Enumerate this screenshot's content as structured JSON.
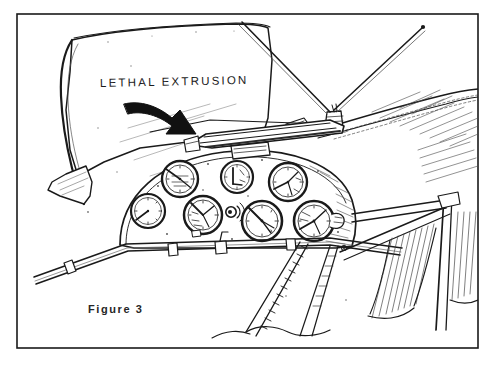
{
  "figure": {
    "caption": "Figure 3",
    "annotation_label": "LETHAL EXTRUSION",
    "medium": "hand-drawn pen-and-ink line illustration",
    "border": {
      "style": "thin black rectangle",
      "color": "#1a1a1a"
    },
    "colors": {
      "ink": "#1a1a1a",
      "paper": "#ffffff",
      "shading": "#4a4a4a",
      "caption_ink": "#262626"
    }
  },
  "scene": {
    "parts": [
      {
        "name": "windscreen-panel",
        "description": "large blank canopy / windscreen panel at upper left"
      },
      {
        "name": "extrusion-rail",
        "description": "protruding metal rail across the top of the instrument panel"
      },
      {
        "name": "instrument-panel",
        "description": "domed instrument panel carrying seven round gauges"
      },
      {
        "name": "antenna-mast",
        "description": "two wire antennas meeting at a mount on the cowling"
      },
      {
        "name": "cowling",
        "description": "engine cowling with riveted seam running to the right"
      },
      {
        "name": "wing-strut",
        "description": "diagonal structural struts and wing framing at right"
      },
      {
        "name": "control-tube",
        "description": "horizontal control tube with clamp fittings below the panel"
      },
      {
        "name": "braided-cable",
        "description": "coiled braided cable running diagonally at lower right"
      }
    ],
    "gauges": [
      {
        "name": "gauge-upper-left",
        "cx": 180,
        "cy": 179,
        "r": 18,
        "needle_deg": -40
      },
      {
        "name": "gauge-upper-mid",
        "cx": 237,
        "cy": 177,
        "r": 16,
        "needle_deg": 20
      },
      {
        "name": "gauge-upper-right",
        "cx": 288,
        "cy": 182,
        "r": 19,
        "needle_deg": 130
      },
      {
        "name": "gauge-lower-far-left",
        "cx": 148,
        "cy": 211,
        "r": 17,
        "needle_deg": -125
      },
      {
        "name": "gauge-lower-left",
        "cx": 203,
        "cy": 215,
        "r": 19,
        "needle_deg": -55
      },
      {
        "name": "gauge-lower-mid",
        "cx": 262,
        "cy": 221,
        "r": 20,
        "needle_deg": -40
      },
      {
        "name": "gauge-lower-right",
        "cx": 314,
        "cy": 221,
        "r": 20,
        "needle_deg": 150
      }
    ],
    "controls": [
      {
        "name": "placard",
        "description": "small rectangular placard at top centre of panel"
      },
      {
        "name": "signal-switch",
        "description": "small switch with radiating signal lines between lower gauges"
      },
      {
        "name": "side-knob",
        "description": "knob protruding from the right side of the lower right gauge"
      }
    ],
    "arrow": {
      "name": "callout-arrow",
      "description": "bold curved arrow pointing down-right from the label to the extrusion rail"
    }
  }
}
